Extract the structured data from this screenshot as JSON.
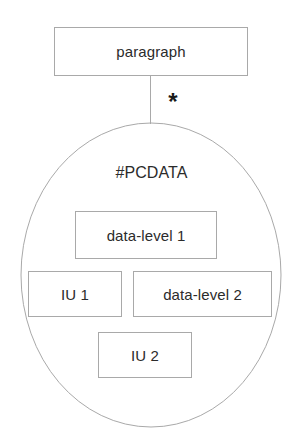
{
  "diagram": {
    "stroke_color": "#a9a9a9",
    "text_color": "#2b2b2b",
    "background_color": "#ffffff",
    "root": {
      "label": "paragraph"
    },
    "connector": {
      "multiplicity": "*"
    },
    "content_group": {
      "label": "#PCDATA",
      "shape": "ellipse",
      "items": [
        {
          "label": "data-level 1"
        },
        {
          "label": "IU 1"
        },
        {
          "label": "data-level 2"
        },
        {
          "label": "IU 2"
        }
      ]
    }
  }
}
